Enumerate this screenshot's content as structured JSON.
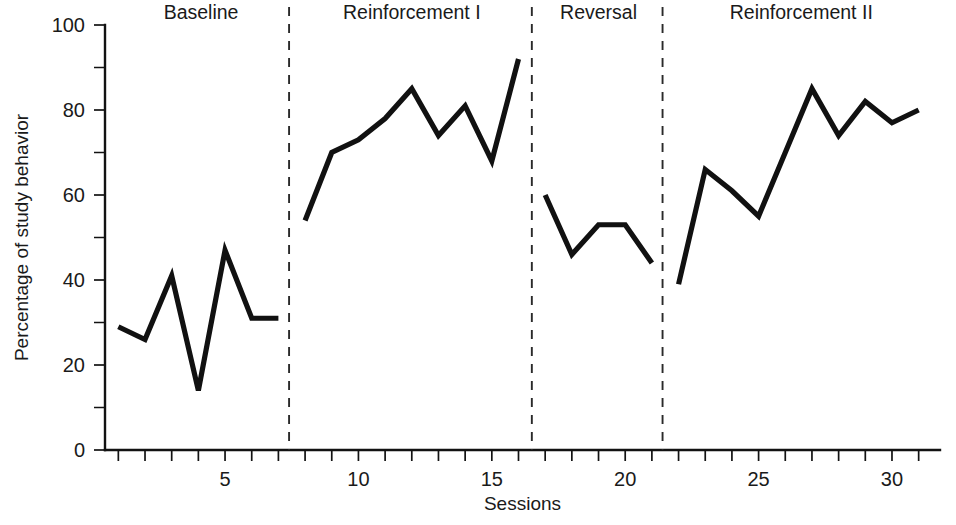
{
  "chart_data": {
    "type": "line",
    "title": "",
    "xlabel": "Sessions",
    "ylabel": "Percentage of study behavior",
    "xlim": [
      0.5,
      31.8
    ],
    "ylim": [
      0,
      100
    ],
    "grid": false,
    "legend": "none",
    "y_ticks_major": [
      0,
      20,
      40,
      60,
      80,
      100
    ],
    "y_ticks_minor": [
      10,
      30,
      50,
      70,
      90
    ],
    "y_tick_labels": [
      "0",
      "20",
      "40",
      "60",
      "80",
      "100"
    ],
    "x_ticks": [
      1,
      2,
      3,
      4,
      5,
      6,
      7,
      8,
      9,
      10,
      11,
      12,
      13,
      14,
      15,
      16,
      17,
      18,
      19,
      20,
      21,
      22,
      23,
      24,
      25,
      26,
      27,
      28,
      29,
      30,
      31
    ],
    "x_tick_labels": [
      {
        "x": 5,
        "label": "5"
      },
      {
        "x": 10,
        "label": "10"
      },
      {
        "x": 15,
        "label": "15"
      },
      {
        "x": 20,
        "label": "20"
      },
      {
        "x": 25,
        "label": "25"
      },
      {
        "x": 30,
        "label": "30"
      }
    ],
    "phase_dividers": [
      7.4,
      16.5,
      21.4
    ],
    "phases": [
      {
        "name": "Baseline",
        "label": "Baseline",
        "center_x": 4.1,
        "x_start": 1,
        "x_end": 7
      },
      {
        "name": "Reinforcement I",
        "label": "Reinforcement I",
        "center_x": 12.0,
        "x_start": 8,
        "x_end": 16
      },
      {
        "name": "Reversal",
        "label": "Reversal",
        "center_x": 19.0,
        "x_start": 17,
        "x_end": 21
      },
      {
        "name": "Reinforcement II",
        "label": "Reinforcement II",
        "center_x": 26.6,
        "x_start": 22,
        "x_end": 31
      }
    ],
    "series": [
      {
        "name": "Baseline",
        "points": [
          {
            "x": 1,
            "y": 29
          },
          {
            "x": 2,
            "y": 26
          },
          {
            "x": 3,
            "y": 41
          },
          {
            "x": 4,
            "y": 14
          },
          {
            "x": 5,
            "y": 47
          },
          {
            "x": 6,
            "y": 31
          },
          {
            "x": 7,
            "y": 31
          }
        ]
      },
      {
        "name": "Reinforcement I",
        "points": [
          {
            "x": 8,
            "y": 54
          },
          {
            "x": 9,
            "y": 70
          },
          {
            "x": 10,
            "y": 73
          },
          {
            "x": 11,
            "y": 78
          },
          {
            "x": 12,
            "y": 85
          },
          {
            "x": 13,
            "y": 74
          },
          {
            "x": 14,
            "y": 81
          },
          {
            "x": 15,
            "y": 68
          },
          {
            "x": 16,
            "y": 92
          }
        ]
      },
      {
        "name": "Reversal",
        "points": [
          {
            "x": 17,
            "y": 60
          },
          {
            "x": 18,
            "y": 46
          },
          {
            "x": 19,
            "y": 53
          },
          {
            "x": 20,
            "y": 53
          },
          {
            "x": 21,
            "y": 44
          }
        ]
      },
      {
        "name": "Reinforcement II",
        "points": [
          {
            "x": 22,
            "y": 39
          },
          {
            "x": 23,
            "y": 66
          },
          {
            "x": 24,
            "y": 61
          },
          {
            "x": 25,
            "y": 55
          },
          {
            "x": 26,
            "y": 70
          },
          {
            "x": 27,
            "y": 85
          },
          {
            "x": 28,
            "y": 74
          },
          {
            "x": 29,
            "y": 82
          },
          {
            "x": 30,
            "y": 77
          },
          {
            "x": 31,
            "y": 80
          }
        ]
      }
    ],
    "colors": {
      "line": "#111111",
      "axis": "#121212",
      "divider": "#2a2a2a",
      "background": "#ffffff",
      "text": "#1a1a1a"
    }
  }
}
